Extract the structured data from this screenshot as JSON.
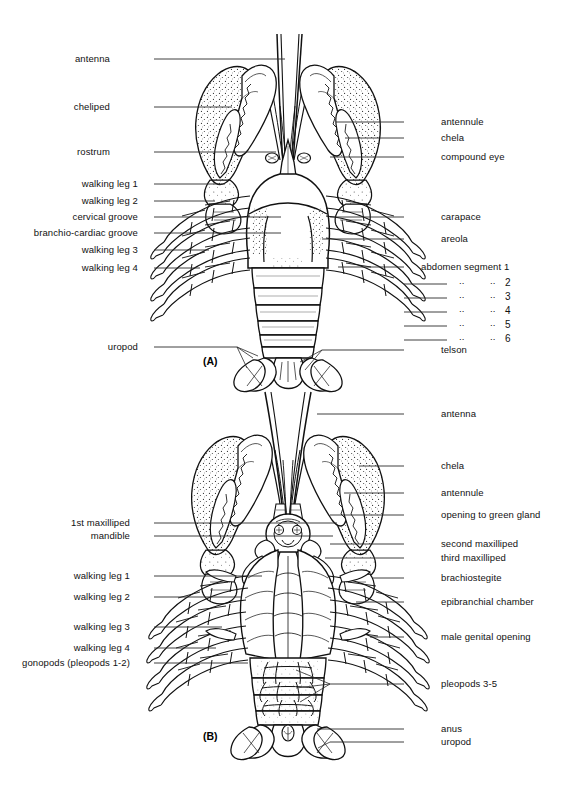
{
  "figure": {
    "panels": [
      {
        "id": "A",
        "mark": "(A)",
        "view": "dorsal"
      },
      {
        "id": "B",
        "mark": "(B)",
        "view": "ventral"
      }
    ]
  },
  "panel_a": {
    "left_labels": [
      {
        "text": "antenna",
        "x": 110,
        "y": 59,
        "lx": 154,
        "ly": 59,
        "tx": 285
      },
      {
        "text": "cheliped",
        "x": 110,
        "y": 107,
        "lx": 154,
        "ly": 107,
        "tx": 232
      },
      {
        "text": "rostrum",
        "x": 110,
        "y": 152,
        "lx": 154,
        "ly": 152,
        "tx": 276
      },
      {
        "text": "walking leg 1",
        "x": 138,
        "y": 184,
        "lx": 154,
        "ly": 184,
        "tx": 225
      },
      {
        "text": "walking leg 2",
        "x": 138,
        "y": 201,
        "lx": 154,
        "ly": 201,
        "tx": 215
      },
      {
        "text": "cervical groove",
        "x": 138,
        "y": 217,
        "lx": 154,
        "ly": 217,
        "tx": 281
      },
      {
        "text": "branchio-cardiac groove",
        "x": 138,
        "y": 233,
        "lx": 154,
        "ly": 233,
        "tx": 281
      },
      {
        "text": "walking leg 3",
        "x": 138,
        "y": 250,
        "lx": 154,
        "ly": 250,
        "tx": 209
      },
      {
        "text": "walking leg 4",
        "x": 138,
        "y": 268,
        "lx": 154,
        "ly": 268,
        "tx": 200
      },
      {
        "text": "uropod",
        "x": 138,
        "y": 347,
        "lx": 154,
        "ly": 347,
        "tx": 237
      }
    ],
    "right_labels": [
      {
        "text": "antennule",
        "x": 441,
        "y": 122,
        "lx": 404,
        "ly": 122,
        "tx": 336
      },
      {
        "text": "chela",
        "x": 441,
        "y": 138,
        "lx": 404,
        "ly": 138,
        "tx": 345
      },
      {
        "text": "compound eye",
        "x": 441,
        "y": 157,
        "lx": 404,
        "ly": 157,
        "tx": 330
      },
      {
        "text": "carapace",
        "x": 441,
        "y": 217,
        "lx": 404,
        "ly": 217,
        "tx": 330
      },
      {
        "text": "areola",
        "x": 441,
        "y": 239,
        "lx": 404,
        "ly": 239,
        "tx": 322
      },
      {
        "text": "abdomen segment 1",
        "x": 421,
        "y": 267,
        "lx": 404,
        "ly": 267,
        "tx": 338
      },
      {
        "text": "telson",
        "x": 441,
        "y": 350,
        "lx": 404,
        "ly": 350,
        "tx": 322
      }
    ],
    "segment_rows": [
      {
        "num": "2",
        "y": 284
      },
      {
        "num": "3",
        "y": 298
      },
      {
        "num": "4",
        "y": 312
      },
      {
        "num": "5",
        "y": 326
      },
      {
        "num": "6",
        "y": 340
      }
    ],
    "ditto_mark": "..",
    "ditto_x1": 459,
    "ditto_x2": 490,
    "num_x": 505,
    "row_line_from": 404,
    "row_line_to": 447,
    "mark": "(A)",
    "mark_x": 203,
    "mark_y": 362
  },
  "panel_b": {
    "left_labels": [
      {
        "text": "1st maxilliped",
        "x": 130,
        "y": 523,
        "lx": 154,
        "ly": 523,
        "tx": 337
      },
      {
        "text": "mandible",
        "x": 130,
        "y": 536,
        "lx": 154,
        "ly": 536,
        "tx": 333
      },
      {
        "text": "walking leg 1",
        "x": 130,
        "y": 576,
        "lx": 154,
        "ly": 576,
        "tx": 262
      },
      {
        "text": "walking leg 2",
        "x": 130,
        "y": 597,
        "lx": 154,
        "ly": 597,
        "tx": 242
      },
      {
        "text": "walking leg 3",
        "x": 130,
        "y": 627,
        "lx": 154,
        "ly": 627,
        "tx": 222
      },
      {
        "text": "walking leg 4",
        "x": 130,
        "y": 648,
        "lx": 154,
        "ly": 648,
        "tx": 216
      },
      {
        "text": "gonopods (pleopods 1-2)",
        "x": 130,
        "y": 663,
        "lx": 154,
        "ly": 663,
        "tx": 248
      }
    ],
    "right_labels": [
      {
        "text": "antenna",
        "x": 441,
        "y": 414,
        "lx": 404,
        "ly": 414,
        "tx": 317
      },
      {
        "text": "chela",
        "x": 441,
        "y": 466,
        "lx": 404,
        "ly": 466,
        "tx": 359
      },
      {
        "text": "antennule",
        "x": 441,
        "y": 493,
        "lx": 404,
        "ly": 493,
        "tx": 344
      },
      {
        "text": "opening to green gland",
        "x": 441,
        "y": 515,
        "lx": 404,
        "ly": 515,
        "tx": 330
      },
      {
        "text": "second maxilliped",
        "x": 441,
        "y": 544,
        "lx": 404,
        "ly": 544,
        "tx": 330
      },
      {
        "text": "third maxilliped",
        "x": 441,
        "y": 558,
        "lx": 404,
        "ly": 558,
        "tx": 325
      },
      {
        "text": "brachiostegite",
        "x": 441,
        "y": 578,
        "lx": 404,
        "ly": 578,
        "tx": 373
      },
      {
        "text": "epibranchial chamber",
        "x": 441,
        "y": 602,
        "lx": 404,
        "ly": 602,
        "tx": 356
      },
      {
        "text": "male genital opening",
        "x": 441,
        "y": 637,
        "lx": 404,
        "ly": 637,
        "tx": 370
      },
      {
        "text": "pleopods  3-5",
        "x": 441,
        "y": 684,
        "lx": 404,
        "ly": 684,
        "tx": 330
      },
      {
        "text": "anus",
        "x": 441,
        "y": 729,
        "lx": 404,
        "ly": 729,
        "tx": 317
      },
      {
        "text": "uropod",
        "x": 441,
        "y": 742,
        "lx": 404,
        "ly": 742,
        "tx": 330
      }
    ],
    "mark": "(B)",
    "mark_x": 203,
    "mark_y": 737
  },
  "colors": {
    "ink": "#111111",
    "leader": "#2a2a2a",
    "background": "#ffffff"
  }
}
